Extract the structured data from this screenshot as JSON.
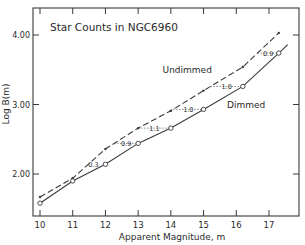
{
  "chart_data": {
    "type": "line",
    "title": "Star Counts in NGC6960",
    "xlabel": "Apparent Magnitude, m",
    "ylabel": "Log B(m)",
    "xlim": [
      9.8,
      18.0
    ],
    "ylim": [
      1.4,
      4.4
    ],
    "xticks": [
      10,
      11,
      12,
      13,
      14,
      15,
      16,
      17
    ],
    "xtick_labels": [
      "10",
      "11",
      "12",
      "13",
      "14",
      "15",
      "16",
      "17"
    ],
    "yticks": [
      2.0,
      3.0,
      4.0
    ],
    "ytick_labels": [
      "2.00",
      "3.00",
      "4.00"
    ],
    "grid": false,
    "legend": "inline labels",
    "series": [
      {
        "name": "Undimmed",
        "style": "dashed",
        "marker": "cross",
        "x": [
          10,
          11,
          12,
          13,
          14,
          15,
          16.2,
          17.3
        ],
        "y": [
          1.67,
          1.94,
          2.36,
          2.66,
          2.91,
          3.2,
          3.54,
          4.03
        ]
      },
      {
        "name": "Dimmed",
        "style": "solid",
        "marker": "circle",
        "x": [
          10,
          11,
          12,
          13,
          14,
          15,
          16.2,
          17.3
        ],
        "y": [
          1.58,
          1.9,
          2.14,
          2.44,
          2.66,
          2.93,
          3.26,
          3.74
        ]
      }
    ],
    "annotations": [
      {
        "text": "0.3",
        "x": 12,
        "y": 2.14
      },
      {
        "text": "0.9",
        "x": 13,
        "y": 2.44
      },
      {
        "text": "1.1",
        "x": 14,
        "y": 2.66
      },
      {
        "text": "1.0",
        "x": 15,
        "y": 2.93
      },
      {
        "text": "1.0",
        "x": 16.2,
        "y": 3.26
      },
      {
        "text": "0.9",
        "x": 17.3,
        "y": 3.74
      }
    ],
    "series_labels": [
      {
        "text": "Undimmed",
        "x": 14.5,
        "y": 3.45
      },
      {
        "text": "Dimmed",
        "x": 16.3,
        "y": 2.95
      }
    ]
  }
}
